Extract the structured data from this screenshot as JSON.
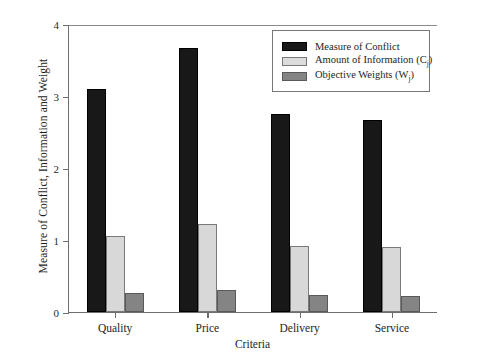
{
  "chart_data": {
    "type": "bar",
    "title": "",
    "xlabel": "Criteria",
    "ylabel": "Measure of Conflict, Information and Weight",
    "categories": [
      "Quality",
      "Price",
      "Delivery",
      "Service"
    ],
    "ylim": [
      0,
      4
    ],
    "yticks": [
      "0",
      "1",
      "2",
      "3",
      "4"
    ],
    "grid": false,
    "legend_position": "top-right",
    "series": [
      {
        "name": "Measure of Conflict",
        "name_plain": "Measure of Conflict",
        "color": "#181818",
        "values": [
          3.1,
          3.67,
          2.75,
          2.67
        ]
      },
      {
        "name": "Amount of Information (C",
        "name_sub": "j",
        "name_tail": ")",
        "name_plain": "Amount of Information (Cj)",
        "color": "#dcdcdc",
        "values": [
          1.06,
          1.22,
          0.92,
          0.9
        ]
      },
      {
        "name": "Objective Weights (W",
        "name_sub": "j",
        "name_tail": ")",
        "name_plain": "Objective Weights (Wj)",
        "color": "#848484",
        "values": [
          0.26,
          0.31,
          0.23,
          0.22
        ]
      }
    ]
  }
}
